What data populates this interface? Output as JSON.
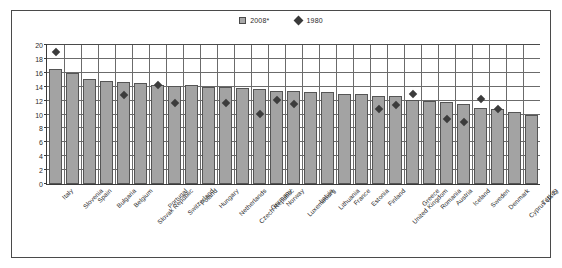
{
  "legend": {
    "position": "top-center",
    "entries": [
      {
        "label": "2008*",
        "icon": "square-swatch",
        "color": "#a8a8a8"
      },
      {
        "label": "1980",
        "icon": "diamond-marker",
        "color": "#3a3a3a"
      }
    ]
  },
  "colors": {
    "bar_fill": "#a3a3a3",
    "bar_stroke": "#555555",
    "marker": "#3c3c3c",
    "grid": "#6b6b6b",
    "axis": "#3a3a3a",
    "frame": "#4a4a4a",
    "background": "#ffffff"
  },
  "chart_data": {
    "type": "bar",
    "title": "",
    "subtitle": "",
    "xlabel": "",
    "ylabel": "",
    "ylim": [
      0,
      20
    ],
    "yticks": [
      0,
      2,
      4,
      6,
      8,
      10,
      12,
      14,
      16,
      18,
      20
    ],
    "grid": true,
    "legend_position": "top-center",
    "categories": [
      "Italy",
      "Slovenia",
      "Spain",
      "Bulgaria",
      "Belgium",
      "Slovak Republic",
      "Portugal",
      "Switzerland",
      "Poland",
      "Hungary",
      "Netherlands",
      "Czech Republic",
      "Germany",
      "Norway",
      "Luxembourg",
      "Latvia",
      "Lithuania",
      "France",
      "Estonia",
      "Finland",
      "United Kingdom",
      "Greece",
      "Romania",
      "Austria",
      "Iceland",
      "Sweden",
      "Denmark",
      "Cyprus (1, 2)",
      "Turkey"
    ],
    "series": [
      {
        "name": "2008*",
        "type": "bar",
        "values": [
          16.6,
          16.0,
          15.1,
          14.8,
          14.7,
          14.5,
          14.2,
          14.1,
          14.2,
          13.9,
          13.9,
          13.8,
          13.7,
          13.4,
          13.4,
          13.3,
          13.2,
          13.0,
          12.9,
          12.7,
          12.6,
          12.1,
          11.9,
          11.8,
          11.5,
          11.0,
          10.8,
          10.4,
          10.0
        ]
      },
      {
        "name": "1980",
        "type": "scatter",
        "values": [
          19.0,
          null,
          null,
          null,
          12.8,
          null,
          14.2,
          11.6,
          null,
          null,
          11.6,
          null,
          10.1,
          12.1,
          11.5,
          null,
          null,
          null,
          null,
          10.8,
          11.4,
          13.0,
          null,
          9.4,
          8.9,
          12.2,
          10.8,
          null,
          null
        ]
      }
    ]
  }
}
